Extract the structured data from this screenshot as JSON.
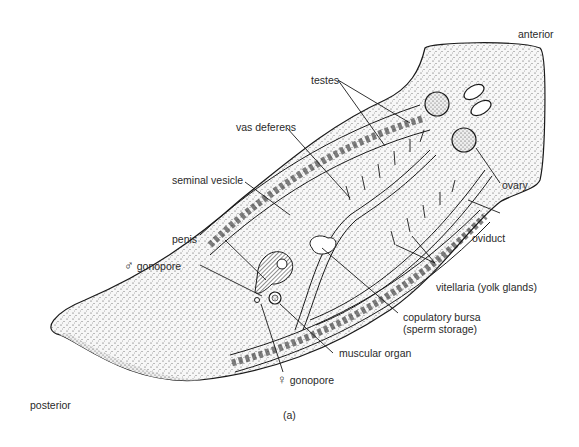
{
  "figure": {
    "caption": "(a)"
  },
  "labels": {
    "anterior": "anterior",
    "posterior": "posterior",
    "testes": "testes",
    "vas_deferens": "vas deferens",
    "seminal_vesicle": "seminal vesicle",
    "ovary": "ovary",
    "oviduct": "oviduct",
    "penis": "penis",
    "male_gonopore_symbol": "♂",
    "male_gonopore": "gonopore",
    "vitellaria": "vitellaria (yolk glands)",
    "copulatory_bursa_line1": "copulatory bursa",
    "copulatory_bursa_line2": "(sperm storage)",
    "muscular_organ": "muscular organ",
    "female_gonopore_symbol": "♀",
    "female_gonopore": "gonopore"
  },
  "colors": {
    "ink": "#1a1a1a",
    "body_fill": "#f2f2f2",
    "background": "#ffffff"
  }
}
